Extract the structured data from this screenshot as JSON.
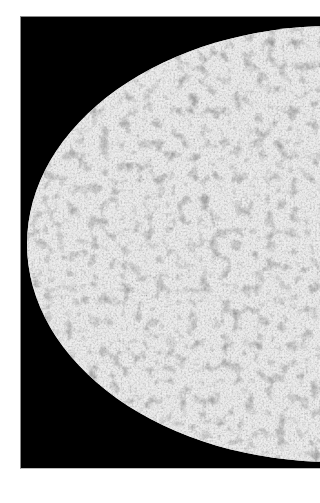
{
  "image": {
    "description": "Left portion of an elliptical (Mollweide-style) all-sky map rendered in grayscale noise on a black background",
    "background_color": "#ffffff",
    "panel_color": "#000000",
    "ellipse": {
      "fill_base": "#bdbdbd",
      "light_tone": "#e6e6e6",
      "dark_tone": "#3a3a3a"
    }
  }
}
